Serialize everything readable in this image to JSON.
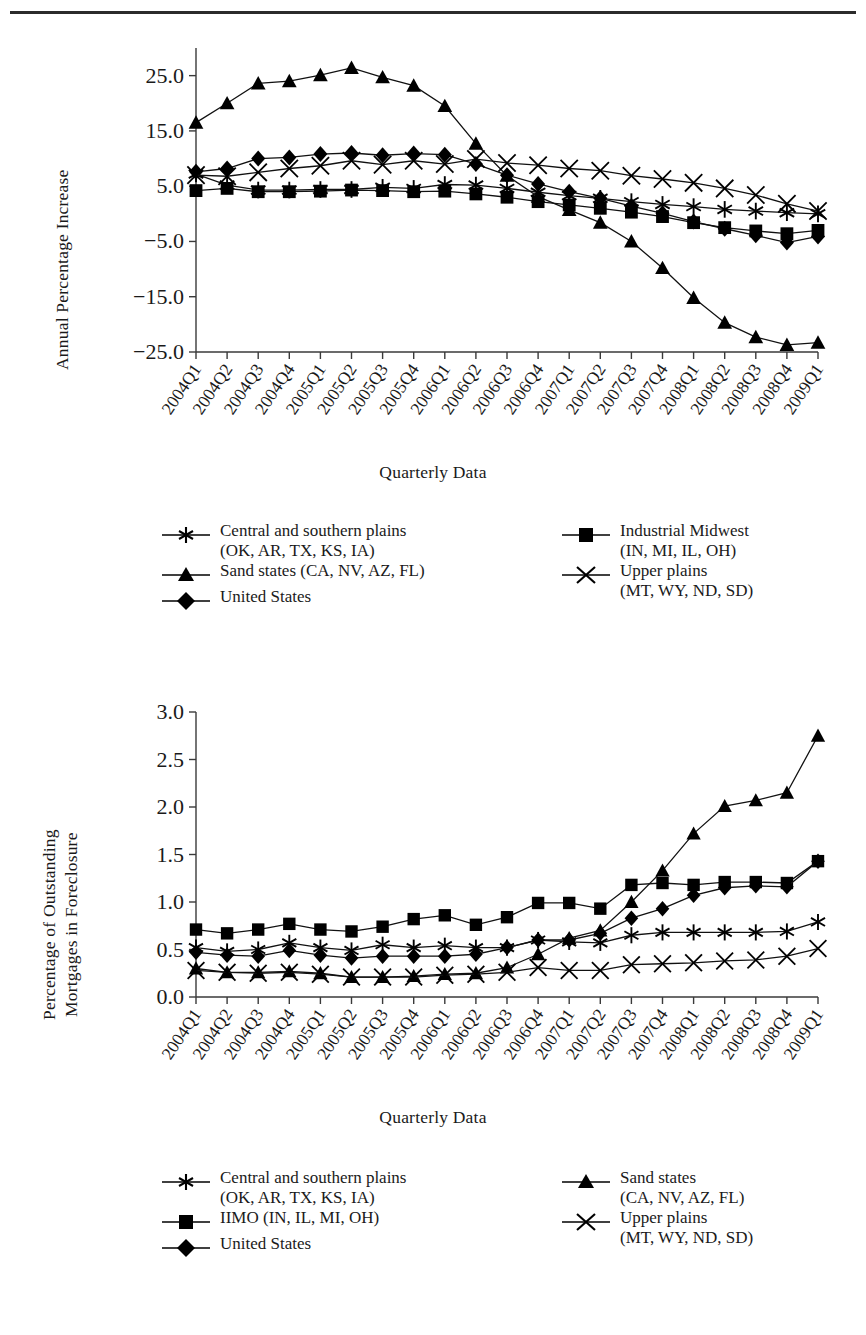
{
  "document": {
    "cutoff_heading": "",
    "rule_color": "#2b2b2b"
  },
  "figures": [
    {
      "id": "figure-1",
      "y_axis_title": "Annual Percentage Increase",
      "x_axis_title": "Quarterly Data",
      "legend": {
        "left": [
          {
            "marker": "star",
            "label": "Central and southern plains\n(OK, AR, TX, KS, IA)"
          },
          {
            "marker": "triangle",
            "label": "Sand states (CA, NV, AZ, FL)"
          },
          {
            "marker": "diamond",
            "label": "United States"
          }
        ],
        "right": [
          {
            "marker": "square",
            "label": "Industrial Midwest\n(IN, MI, IL, OH)"
          },
          {
            "marker": "cross",
            "label": "Upper plains\n(MT, WY, ND, SD)"
          }
        ]
      }
    },
    {
      "id": "figure-2",
      "y_axis_title_line1": "Percentage of Outstanding",
      "y_axis_title_line2": "Mortgages in Foreclosure",
      "x_axis_title": "Quarterly Data",
      "legend": {
        "left": [
          {
            "marker": "star",
            "label": "Central and southern plains\n(OK, AR, TX, KS, IA)"
          },
          {
            "marker": "square",
            "label": "IIMO (IN, IL, MI, OH)"
          },
          {
            "marker": "diamond",
            "label": "United States"
          }
        ],
        "right": [
          {
            "marker": "triangle",
            "label": "Sand states\n(CA, NV, AZ, FL)"
          },
          {
            "marker": "cross",
            "label": "Upper plains\n(MT, WY, ND, SD)"
          }
        ]
      }
    }
  ],
  "chart_data": [
    {
      "type": "line",
      "title": "",
      "xlabel": "Quarterly Data",
      "ylabel": "Annual Percentage Increase",
      "grid": false,
      "legend_position": "below",
      "ylim": [
        -25.0,
        30.0
      ],
      "yticks": [
        25.0,
        15.0,
        5.0,
        -5.0,
        -15.0,
        -25.0
      ],
      "ytick_labels": [
        "25.0",
        "15.0",
        "5.0",
        "-5.0",
        "-15.0",
        "-25.0"
      ],
      "categories": [
        "2004Q1",
        "2004Q2",
        "2004Q3",
        "2004Q4",
        "2005Q1",
        "2005Q2",
        "2005Q3",
        "2005Q4",
        "2006Q1",
        "2006Q2",
        "2006Q3",
        "2006Q4",
        "2007Q1",
        "2007Q2",
        "2007Q3",
        "2007Q4",
        "2008Q1",
        "2008Q2",
        "2008Q3",
        "2008Q4",
        "2009Q1"
      ],
      "series": [
        {
          "name": "Central and southern plains (OK, AR, TX, KS, IA)",
          "marker": "star",
          "values": [
            7.2,
            5.2,
            4.3,
            4.3,
            4.4,
            4.4,
            4.8,
            4.6,
            5.3,
            5.2,
            4.6,
            3.9,
            3.3,
            2.8,
            2.2,
            1.7,
            1.3,
            0.8,
            0.5,
            0.2,
            0.0
          ]
        },
        {
          "name": "Sand states (CA, NV, AZ, FL)",
          "marker": "triangle",
          "values": [
            16.5,
            20.0,
            23.6,
            24.0,
            25.1,
            26.4,
            24.7,
            23.2,
            19.5,
            12.7,
            6.9,
            3.1,
            0.7,
            -1.6,
            -5.0,
            -9.8,
            -15.2,
            -19.7,
            -22.3,
            -23.7,
            -23.3
          ]
        },
        {
          "name": "United States",
          "marker": "diamond",
          "values": [
            7.6,
            8.2,
            10.0,
            10.2,
            10.8,
            11.0,
            10.6,
            10.9,
            10.7,
            9.0,
            7.0,
            5.4,
            4.0,
            2.8,
            1.4,
            0.1,
            -1.4,
            -2.7,
            -3.9,
            -5.2,
            -4.1
          ]
        },
        {
          "name": "Industrial Midwest (IN, MI, IL, OH)",
          "marker": "square",
          "values": [
            4.2,
            4.6,
            4.0,
            4.0,
            4.1,
            4.3,
            4.2,
            4.0,
            4.1,
            3.6,
            3.0,
            2.2,
            1.6,
            1.0,
            0.3,
            -0.5,
            -1.6,
            -2.5,
            -3.1,
            -3.6,
            -3.0
          ]
        },
        {
          "name": "Upper plains (MT, WY, ND, SD)",
          "marker": "cross",
          "values": [
            7.0,
            6.8,
            7.5,
            8.2,
            8.7,
            9.6,
            8.9,
            9.6,
            9.0,
            9.9,
            9.2,
            8.8,
            8.2,
            7.8,
            6.9,
            6.3,
            5.6,
            4.6,
            3.4,
            1.8,
            0.5
          ]
        }
      ]
    },
    {
      "type": "line",
      "title": "",
      "xlabel": "Quarterly Data",
      "ylabel": "Percentage of Outstanding Mortgages in Foreclosure",
      "grid": false,
      "legend_position": "below",
      "ylim": [
        0.0,
        3.0
      ],
      "yticks": [
        0.0,
        0.5,
        1.0,
        1.5,
        2.0,
        2.5,
        3.0
      ],
      "ytick_labels": [
        "0.0",
        "0.5",
        "1.0",
        "1.5",
        "2.0",
        "2.5",
        "3.0"
      ],
      "categories": [
        "2004Q1",
        "2004Q2",
        "2004Q3",
        "2004Q4",
        "2005Q1",
        "2005Q2",
        "2005Q3",
        "2005Q4",
        "2006Q1",
        "2006Q2",
        "2006Q3",
        "2006Q4",
        "2007Q1",
        "2007Q2",
        "2007Q3",
        "2007Q4",
        "2008Q1",
        "2008Q2",
        "2008Q3",
        "2008Q4",
        "2009Q1"
      ],
      "series": [
        {
          "name": "Central and southern plains (OK, AR, TX, KS, IA)",
          "marker": "star",
          "values": [
            0.52,
            0.48,
            0.5,
            0.57,
            0.52,
            0.49,
            0.55,
            0.52,
            0.54,
            0.52,
            0.52,
            0.6,
            0.58,
            0.57,
            0.65,
            0.68,
            0.68,
            0.68,
            0.68,
            0.69,
            0.79
          ]
        },
        {
          "name": "IIMO (IN, IL, MI, OH)",
          "marker": "square",
          "values": [
            0.71,
            0.67,
            0.71,
            0.77,
            0.71,
            0.69,
            0.74,
            0.82,
            0.86,
            0.76,
            0.84,
            0.99,
            0.99,
            0.93,
            1.18,
            1.2,
            1.18,
            1.21,
            1.21,
            1.2,
            1.43
          ]
        },
        {
          "name": "United States",
          "marker": "diamond",
          "values": [
            0.47,
            0.44,
            0.43,
            0.49,
            0.44,
            0.41,
            0.43,
            0.43,
            0.43,
            0.45,
            0.52,
            0.6,
            0.6,
            0.67,
            0.83,
            0.93,
            1.07,
            1.15,
            1.17,
            1.16,
            1.43
          ]
        },
        {
          "name": "Sand states (CA, NV, AZ, FL)",
          "marker": "triangle",
          "values": [
            0.3,
            0.26,
            0.26,
            0.27,
            0.25,
            0.21,
            0.21,
            0.22,
            0.24,
            0.25,
            0.31,
            0.45,
            0.62,
            0.7,
            1.0,
            1.33,
            1.72,
            2.01,
            2.07,
            2.15,
            2.75
          ]
        },
        {
          "name": "Upper plains (MT, WY, ND, SD)",
          "marker": "cross",
          "values": [
            0.28,
            0.26,
            0.25,
            0.26,
            0.24,
            0.21,
            0.21,
            0.21,
            0.23,
            0.24,
            0.26,
            0.31,
            0.28,
            0.28,
            0.34,
            0.35,
            0.36,
            0.38,
            0.39,
            0.43,
            0.51
          ]
        }
      ]
    }
  ]
}
